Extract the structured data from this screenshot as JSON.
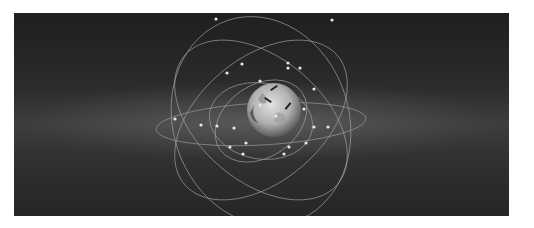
{
  "image": {
    "subject": "Earth with satellite constellation orbits",
    "colors": {
      "background_top": "#1f1f1f",
      "background_mid": "#3d3d3d",
      "orbit_line": "#a8a8a8",
      "satellite": "#e8e8e8",
      "planet_light": "#d6d6d6",
      "planet_dark": "#5a5a5a",
      "page_background": "#ffffff"
    },
    "orbits": [
      {
        "cx": 247,
        "cy": 111,
        "rx": 105,
        "ry": 21,
        "rotate": -3
      },
      {
        "cx": 247,
        "cy": 107,
        "rx": 100,
        "ry": 62,
        "rotate": 40
      },
      {
        "cx": 247,
        "cy": 107,
        "rx": 100,
        "ry": 62,
        "rotate": -40
      },
      {
        "cx": 247,
        "cy": 108,
        "rx": 106,
        "ry": 88,
        "rotate": 72
      },
      {
        "cx": 247,
        "cy": 108,
        "rx": 52,
        "ry": 38,
        "rotate": 10
      },
      {
        "cx": 247,
        "cy": 108,
        "rx": 50,
        "ry": 36,
        "rotate": -35
      }
    ],
    "satellites": [
      [
        202,
        6
      ],
      [
        318,
        7
      ],
      [
        228,
        51
      ],
      [
        274,
        50
      ],
      [
        286,
        55
      ],
      [
        274,
        55
      ],
      [
        213,
        60
      ],
      [
        246,
        68
      ],
      [
        300,
        76
      ],
      [
        290,
        96
      ],
      [
        300,
        114
      ],
      [
        314,
        114
      ],
      [
        161,
        106
      ],
      [
        187,
        112
      ],
      [
        203,
        113
      ],
      [
        220,
        115
      ],
      [
        232,
        130
      ],
      [
        216,
        134
      ],
      [
        229,
        141
      ],
      [
        275,
        134
      ],
      [
        292,
        130
      ],
      [
        270,
        141
      ],
      [
        246,
        92
      ],
      [
        262,
        103
      ]
    ]
  }
}
